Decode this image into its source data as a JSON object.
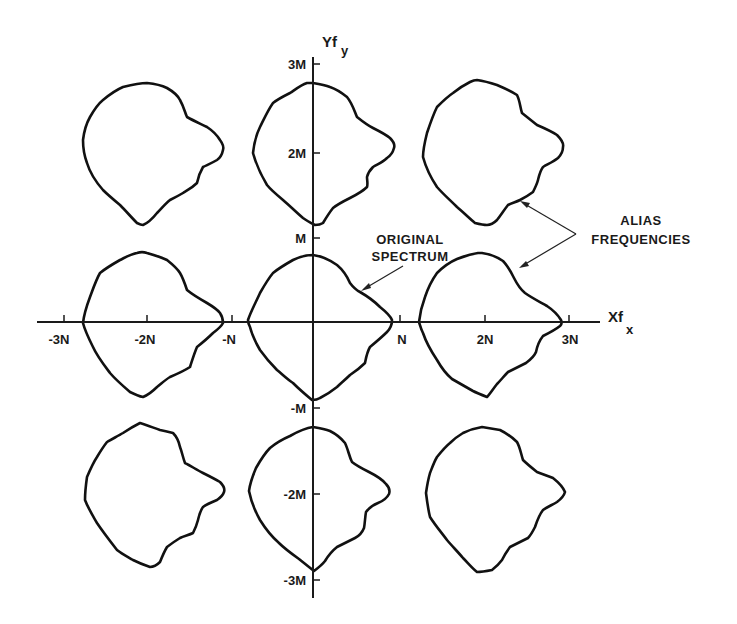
{
  "figure": {
    "type": "diagram",
    "colors": {
      "ink": "#1a1a1a",
      "background": "#ffffff"
    },
    "axes": {
      "x": {
        "title": "Xf",
        "subscript": "x",
        "ticks": [
          {
            "label": "-3N",
            "value": -3
          },
          {
            "label": "-2N",
            "value": -2
          },
          {
            "label": "-N",
            "value": -1
          },
          {
            "label": "N",
            "value": 1
          },
          {
            "label": "2N",
            "value": 2
          },
          {
            "label": "3N",
            "value": 3
          }
        ]
      },
      "y": {
        "title": "Yf",
        "subscript": "y",
        "ticks": [
          {
            "label": "3M",
            "value": 3
          },
          {
            "label": "2M",
            "value": 2
          },
          {
            "label": "M",
            "value": 1
          },
          {
            "label": "-M",
            "value": -1
          },
          {
            "label": "-2M",
            "value": -2
          },
          {
            "label": "-3M",
            "value": -3
          }
        ]
      }
    },
    "annotations": {
      "original": {
        "line1": "ORIGINAL",
        "line2": "SPECTRUM"
      },
      "alias": {
        "line1": "ALIAS",
        "line2": "FREQUENCIES"
      }
    },
    "spectra": [
      {
        "name": "top-left",
        "center": [
          -2,
          2
        ],
        "kind": "alias"
      },
      {
        "name": "top-center",
        "center": [
          0,
          2
        ],
        "kind": "alias"
      },
      {
        "name": "top-right",
        "center": [
          2,
          2
        ],
        "kind": "alias"
      },
      {
        "name": "middle-left",
        "center": [
          -2,
          0
        ],
        "kind": "alias"
      },
      {
        "name": "center",
        "center": [
          0,
          0
        ],
        "kind": "original"
      },
      {
        "name": "middle-right",
        "center": [
          2,
          0
        ],
        "kind": "alias"
      },
      {
        "name": "bottom-left",
        "center": [
          -2,
          -2
        ],
        "kind": "alias"
      },
      {
        "name": "bottom-center",
        "center": [
          0,
          -2
        ],
        "kind": "alias"
      },
      {
        "name": "bottom-right",
        "center": [
          2,
          -2
        ],
        "kind": "alias"
      }
    ]
  }
}
